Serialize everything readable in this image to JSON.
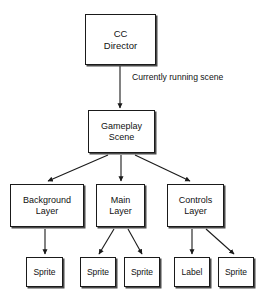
{
  "diagram": {
    "type": "tree-diagram",
    "colors": {
      "background": "#ffffff",
      "node_fill": "#ffffff",
      "node_border": "#1a1a1a",
      "node_shadow": "#4a4a4a",
      "text": "#111111",
      "edge": "#1a1a1a"
    },
    "nodes": [
      {
        "id": "cc-director",
        "label": "CC\nDirector",
        "x": 85,
        "y": 14,
        "w": 71,
        "h": 51,
        "size": "lg"
      },
      {
        "id": "gameplay-scene",
        "label": "Gameplay\nScene",
        "x": 88,
        "y": 110,
        "w": 67,
        "h": 43,
        "size": "md"
      },
      {
        "id": "background-layer",
        "label": "Background\nLayer",
        "x": 10,
        "y": 184,
        "w": 74,
        "h": 43,
        "size": "md"
      },
      {
        "id": "main-layer",
        "label": "Main\nLayer",
        "x": 96,
        "y": 184,
        "w": 49,
        "h": 43,
        "size": "md"
      },
      {
        "id": "controls-layer",
        "label": "Controls\nLayer",
        "x": 167,
        "y": 184,
        "w": 57,
        "h": 43,
        "size": "md"
      },
      {
        "id": "sprite-bg-1",
        "label": "Sprite",
        "x": 26,
        "y": 257,
        "w": 37,
        "h": 30,
        "size": "sm"
      },
      {
        "id": "sprite-main-1",
        "label": "Sprite",
        "x": 80,
        "y": 257,
        "w": 36,
        "h": 30,
        "size": "sm"
      },
      {
        "id": "sprite-main-2",
        "label": "Sprite",
        "x": 124,
        "y": 257,
        "w": 36,
        "h": 30,
        "size": "sm"
      },
      {
        "id": "label-controls-1",
        "label": "Label",
        "x": 174,
        "y": 257,
        "w": 36,
        "h": 30,
        "size": "sm"
      },
      {
        "id": "sprite-controls-1",
        "label": "Sprite",
        "x": 218,
        "y": 257,
        "w": 36,
        "h": 30,
        "size": "sm"
      }
    ],
    "edges": [
      {
        "id": "edge-director-to-scene",
        "from": "cc-director",
        "to": "gameplay-scene",
        "x1": 120,
        "y1": 66,
        "x2": 120,
        "y2": 108,
        "annotation": "Currently running scene"
      },
      {
        "id": "edge-scene-to-background",
        "from": "gameplay-scene",
        "to": "background-layer",
        "x1": 108,
        "y1": 155,
        "x2": 48,
        "y2": 181,
        "annotation": ""
      },
      {
        "id": "edge-scene-to-main",
        "from": "gameplay-scene",
        "to": "main-layer",
        "x1": 121,
        "y1": 155,
        "x2": 121,
        "y2": 181,
        "annotation": ""
      },
      {
        "id": "edge-scene-to-controls",
        "from": "gameplay-scene",
        "to": "controls-layer",
        "x1": 135,
        "y1": 155,
        "x2": 190,
        "y2": 181,
        "annotation": ""
      },
      {
        "id": "edge-background-to-sprite",
        "from": "background-layer",
        "to": "sprite-bg-1",
        "x1": 45,
        "y1": 229,
        "x2": 45,
        "y2": 254,
        "annotation": ""
      },
      {
        "id": "edge-main-to-sprite-1",
        "from": "main-layer",
        "to": "sprite-main-1",
        "x1": 114,
        "y1": 229,
        "x2": 99,
        "y2": 254,
        "annotation": ""
      },
      {
        "id": "edge-main-to-sprite-2",
        "from": "main-layer",
        "to": "sprite-main-2",
        "x1": 128,
        "y1": 229,
        "x2": 142,
        "y2": 254,
        "annotation": ""
      },
      {
        "id": "edge-controls-to-label",
        "from": "controls-layer",
        "to": "label-controls-1",
        "x1": 192,
        "y1": 229,
        "x2": 192,
        "y2": 254,
        "annotation": ""
      },
      {
        "id": "edge-controls-to-sprite",
        "from": "controls-layer",
        "to": "sprite-controls-1",
        "x1": 206,
        "y1": 229,
        "x2": 234,
        "y2": 254,
        "annotation": ""
      }
    ],
    "annotations": [
      {
        "id": "annotation-currently-running-scene",
        "text": "Currently running scene",
        "x": 132,
        "y": 72
      }
    ]
  }
}
